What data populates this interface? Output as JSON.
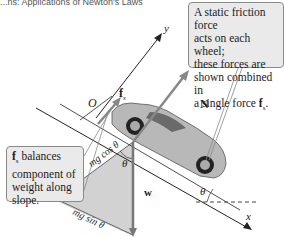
{
  "header": {
    "text": "...ns: Applications of Newton's Laws"
  },
  "callouts": {
    "top": {
      "lines": [
        "A static friction force",
        "acts  on each wheel;",
        "these forces are",
        "shown combined in"
      ],
      "last_prefix": "a single force ",
      "force_symbol": "f",
      "force_sub": "s",
      "suffix": "."
    },
    "left": {
      "force_symbol": "f",
      "force_sub": "s",
      "first_line_rest": " balances",
      "lines": [
        "component of",
        "weight along",
        "slope."
      ]
    }
  },
  "labels": {
    "y_axis": "y",
    "x_axis": "x",
    "origin": "O",
    "friction": "f",
    "friction_sub": "s",
    "normal": "N",
    "weight": "w",
    "theta": "θ",
    "mg_cos": "mg cos θ",
    "mg_sin": "mg sin θ"
  },
  "colors": {
    "vector": "#777777",
    "triangle_fill": "#cfcfcf",
    "callout_bg": "#eaeaea",
    "axis": "#222222"
  }
}
